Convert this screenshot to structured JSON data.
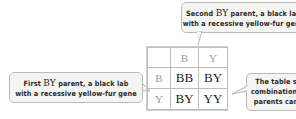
{
  "callouts": {
    "top": {
      "line1_pre": "Second ",
      "line1_geno": "BY",
      "line1_post": " parent, a black lab",
      "line2": "with a recessive yellow-fur gene"
    },
    "left": {
      "line1_pre": "First ",
      "line1_geno": "BY",
      "line1_post": " parent, a black lab",
      "line2": "with a recessive yellow-fur gene"
    },
    "right": {
      "line1": "The table s",
      "line2": "combinations",
      "line3": "parents can"
    }
  },
  "punnett": {
    "col_headers": [
      "B",
      "Y"
    ],
    "row_headers": [
      "B",
      "Y"
    ],
    "cells": [
      [
        "BB",
        "BY"
      ],
      [
        "BY",
        "YY"
      ]
    ]
  },
  "colors": {
    "callout_bg": "#f4f4f2",
    "callout_border": "#b9b9b5",
    "grid": "#bdbdbd",
    "header_text": "#9a9a9a"
  }
}
